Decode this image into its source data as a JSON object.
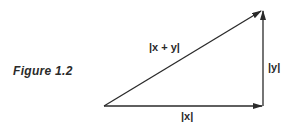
{
  "figure": {
    "caption": "Figure 1.2"
  },
  "diagram": {
    "type": "vector-triangle",
    "vectors": [
      {
        "id": "x",
        "label": "|x|",
        "direction": "right"
      },
      {
        "id": "y",
        "label": "|y|",
        "direction": "up"
      },
      {
        "id": "x_plus_y",
        "label": "|x + y|",
        "direction": "up-right (hypotenuse)"
      }
    ],
    "colors": {
      "stroke": "#2a2a2a",
      "background": "#ffffff"
    }
  }
}
